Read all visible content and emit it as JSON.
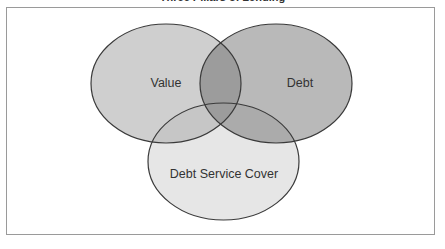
{
  "title": "Three Pillars of Lending",
  "diagram": {
    "type": "venn",
    "sets": [
      {
        "id": "value",
        "label": "Value",
        "color": "#cfcfcf"
      },
      {
        "id": "debt",
        "label": "Debt",
        "color": "#b9b9b9"
      },
      {
        "id": "dsc",
        "label": "Debt Service Cover",
        "color": "#e6e6e6"
      }
    ],
    "colors": {
      "outline": "#3a3a3a",
      "overlap_value_debt": "#9c9c9c",
      "overlap_debt_dsc": "#a9a9a9",
      "overlap_value_dsc": "#c8c8c8",
      "frame": "#9a9a9a"
    }
  }
}
